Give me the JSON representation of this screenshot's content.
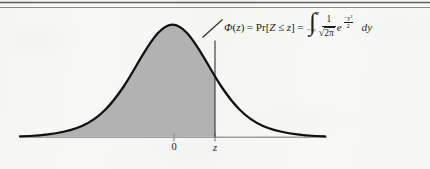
{
  "figure": {
    "kind": "statistics-textbook-figure",
    "background_color": "#f8f8f6",
    "rules": {
      "count": 2,
      "color": "#6b6b6b",
      "positions_y": [
        2,
        7
      ]
    },
    "curve": {
      "stroke_color": "#111111",
      "stroke_width": 2.2,
      "fill_color": "#b2b2b2",
      "peak_x": 172,
      "peak_y": 25,
      "left_tail_x": 20,
      "right_tail_x": 325
    },
    "axis": {
      "color": "#9a9a9a",
      "baseline_y": 137,
      "x_start": 20,
      "x_end": 327
    },
    "z_line": {
      "x": 215,
      "color": "#333333"
    },
    "leader_line": {
      "from_x": 222,
      "from_y": 20,
      "to_x": 203,
      "to_y": 37,
      "color": "#2a2a2a"
    },
    "ticks": [
      {
        "name": "origin",
        "x": 174,
        "label": "0"
      },
      {
        "name": "z-value",
        "x": 215,
        "label": "z"
      }
    ]
  },
  "formula": {
    "full_text": "Φ(z) = Pr[Z ≤ z] = ∫_{-∞}^{z} (1/√(2π)) e^{-y²/2} dy",
    "phi": "Φ",
    "paren_open": "(",
    "var_z_lower": "z",
    "paren_close": ")",
    "equals": "=",
    "pr": "Pr",
    "bracket_open": "[",
    "var_Z_upper": "Z",
    "leq": "≤",
    "var_z_lower2": "z",
    "bracket_close": "]",
    "equals2": "=",
    "integral_sign": "∫",
    "limit_upper": "z",
    "limit_lower": "−∞",
    "fraction_numerator": "1",
    "sqrt_symbol": "√",
    "sqrt_radicand": "2π",
    "e_base": "e",
    "exponent_numerator": "−y²",
    "exponent_denominator": "2",
    "differential": "dy"
  },
  "labels": {
    "tick_zero": "0",
    "tick_z": "z"
  }
}
